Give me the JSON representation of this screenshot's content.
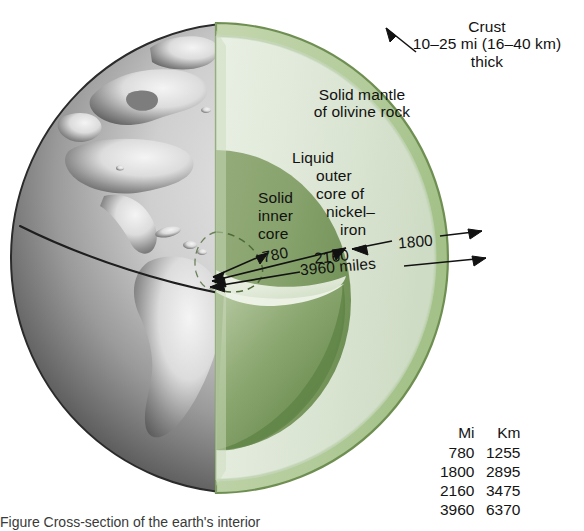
{
  "figure": {
    "caption_partial": "Figure    Cross-section of the earth's interior"
  },
  "labels": {
    "crust": {
      "line1": "Crust",
      "line2": "10–25 mi (16–40 km)",
      "line3": "thick"
    },
    "mantle": {
      "line1": "Solid mantle",
      "line2": "of olivine rock"
    },
    "outer_core": {
      "line1": "Liquid",
      "line2": "outer",
      "line3": "core of",
      "line4": "nickel–",
      "line5": "iron"
    },
    "inner_core": {
      "line1": "Solid",
      "line2": "inner",
      "line3": "core"
    }
  },
  "measurements": {
    "inner_core_radius": "780",
    "outer_core_diameter": "2160",
    "mantle_thickness": "1800",
    "earth_diameter": "3960 miles"
  },
  "conversion_table": {
    "headers": [
      "Mi",
      "Km"
    ],
    "rows": [
      {
        "mi": "780",
        "km": "1255"
      },
      {
        "mi": "1800",
        "km": "2895"
      },
      {
        "mi": "2160",
        "km": "3475"
      },
      {
        "mi": "3960",
        "km": "6370"
      }
    ]
  },
  "colors": {
    "crust_band": "#b7ce9f",
    "crust_outline": "#6f8f52",
    "mantle": "#dde7d6",
    "mantle_shade": "#cfdcc6",
    "outer_core": "#84a06a",
    "outer_core_dark": "#6e8f55",
    "inner_core_floor": "#e6eede",
    "globe_light": "#d6d6d6",
    "globe_mid": "#8e8e8e",
    "globe_dark": "#3b3b3b",
    "ink": "#111111"
  },
  "globe": {
    "description": "Grayscale shaded globe showing North and South America with an equator line"
  }
}
